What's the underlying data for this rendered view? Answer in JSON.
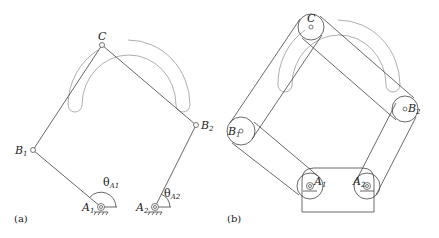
{
  "figure": {
    "panel_a": {
      "caption": "(a)",
      "labels": {
        "C": "C",
        "B1": "B",
        "B1_sub": "1",
        "B2": "B",
        "B2_sub": "2",
        "A1": "A",
        "A1_sub": "1",
        "A2": "A",
        "A2_sub": "2",
        "theta1": "θ",
        "theta1_sub": "A1",
        "theta2": "θ",
        "theta2_sub": "A2"
      },
      "points": {
        "C": [
          102,
          45
        ],
        "B1": [
          33,
          150
        ],
        "B2": [
          196,
          125
        ],
        "A1": [
          101,
          207
        ],
        "A2": [
          155,
          207
        ]
      }
    },
    "panel_b": {
      "caption": "(b)",
      "labels": {
        "C": "C",
        "B1": "B",
        "B1_sub": "1",
        "B2": "B",
        "B2_sub": "2",
        "A1": "A",
        "A1_sub": "1",
        "A2": "A",
        "A2_sub": "2"
      },
      "points": {
        "C": [
          311,
          27
        ],
        "B1": [
          241,
          131
        ],
        "B2": [
          405,
          109
        ],
        "A1": [
          310,
          186
        ],
        "A2": [
          367,
          186
        ]
      }
    }
  }
}
